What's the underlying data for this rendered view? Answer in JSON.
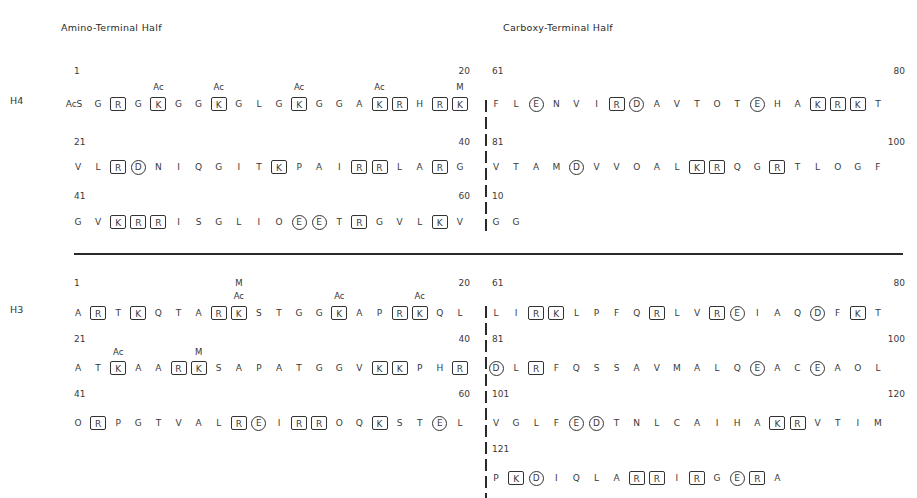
{
  "titles": {
    "amino": "Amino-Terminal Half",
    "carboxy": "Carboxy-Terminal Half"
  },
  "legend_semantics": {
    "box": "basic residue (K/R) boxed",
    "circle": "acidic residue (D/E) circled",
    "Ac": "acetylation site",
    "M": "methylation site"
  },
  "histones": [
    {
      "label": "H4",
      "label_y": 101,
      "rows": [
        {
          "side": "left",
          "start": "1",
          "end": "20",
          "num_y": 66,
          "seq_y": 97,
          "residues": [
            "AcS",
            "G",
            "R",
            "G",
            "K",
            "G",
            "G",
            "K",
            "G",
            "L",
            "G",
            "K",
            "G",
            "G",
            "A",
            "K",
            "R",
            "H",
            "R",
            "K"
          ],
          "marks": [
            "",
            "",
            "box",
            "",
            "box",
            "",
            "",
            "box",
            "",
            "",
            "",
            "box",
            "",
            "",
            "",
            "box",
            "box",
            "",
            "box",
            "box"
          ],
          "mods": [
            {
              "index": 4,
              "text": "Ac",
              "y": 82
            },
            {
              "index": 7,
              "text": "Ac",
              "y": 82
            },
            {
              "index": 11,
              "text": "Ac",
              "y": 82
            },
            {
              "index": 15,
              "text": "Ac",
              "y": 82
            },
            {
              "index": 19,
              "text": "M",
              "y": 82
            }
          ]
        },
        {
          "side": "left",
          "start": "21",
          "end": "40",
          "num_y": 137,
          "seq_y": 160,
          "residues": [
            "V",
            "L",
            "R",
            "D",
            "N",
            "I",
            "Q",
            "G",
            "I",
            "T",
            "K",
            "P",
            "A",
            "I",
            "R",
            "R",
            "L",
            "A",
            "R",
            "G"
          ],
          "marks": [
            "",
            "",
            "box",
            "circ",
            "",
            "",
            "",
            "",
            "",
            "",
            "box",
            "",
            "",
            "",
            "box",
            "box",
            "",
            "",
            "box",
            ""
          ],
          "mods": []
        },
        {
          "side": "left",
          "start": "41",
          "end": "60",
          "num_y": 191,
          "seq_y": 215,
          "residues": [
            "G",
            "V",
            "K",
            "R",
            "R",
            "I",
            "S",
            "G",
            "L",
            "I",
            "O",
            "E",
            "E",
            "T",
            "R",
            "G",
            "V",
            "L",
            "K",
            "V"
          ],
          "marks": [
            "",
            "",
            "box",
            "box",
            "box",
            "",
            "",
            "",
            "",
            "",
            "",
            "circ",
            "circ",
            "",
            "box",
            "",
            "",
            "",
            "box",
            ""
          ],
          "mods": []
        },
        {
          "side": "right",
          "start": "61",
          "end": "80",
          "num_y": 66,
          "seq_y": 97,
          "residues": [
            "F",
            "L",
            "E",
            "N",
            "V",
            "I",
            "R",
            "D",
            "A",
            "V",
            "T",
            "O",
            "T",
            "E",
            "H",
            "A",
            "K",
            "R",
            "K",
            "T"
          ],
          "marks": [
            "",
            "",
            "circ",
            "",
            "",
            "",
            "box",
            "circ",
            "",
            "",
            "",
            "",
            "",
            "circ",
            "",
            "",
            "box",
            "box",
            "box",
            ""
          ],
          "mods": []
        },
        {
          "side": "right",
          "start": "81",
          "end": "100",
          "num_y": 137,
          "seq_y": 160,
          "residues": [
            "V",
            "T",
            "A",
            "M",
            "D",
            "V",
            "V",
            "O",
            "A",
            "L",
            "K",
            "R",
            "Q",
            "G",
            "R",
            "T",
            "L",
            "O",
            "G",
            "F"
          ],
          "marks": [
            "",
            "",
            "",
            "",
            "circ",
            "",
            "",
            "",
            "",
            "",
            "box",
            "box",
            "",
            "",
            "box",
            "",
            "",
            "",
            "",
            ""
          ],
          "mods": []
        },
        {
          "side": "right",
          "start": "10",
          "end": "",
          "num_y": 191,
          "seq_y": 215,
          "residues": [
            "G",
            "G"
          ],
          "marks": [
            "",
            ""
          ],
          "mods": []
        }
      ]
    },
    {
      "label": "H3",
      "label_y": 310,
      "rows": [
        {
          "side": "left",
          "start": "1",
          "end": "20",
          "num_y": 278,
          "seq_y": 306,
          "residues": [
            "A",
            "R",
            "T",
            "K",
            "Q",
            "T",
            "A",
            "R",
            "K",
            "S",
            "T",
            "G",
            "G",
            "K",
            "A",
            "P",
            "R",
            "K",
            "Q",
            "L"
          ],
          "marks": [
            "",
            "box",
            "",
            "box",
            "",
            "",
            "",
            "box",
            "box",
            "",
            "",
            "",
            "",
            "box",
            "",
            "",
            "box",
            "box",
            "",
            ""
          ],
          "mods": [
            {
              "index": 8,
              "text": "M",
              "y": 278
            },
            {
              "index": 8,
              "text": "Ac",
              "y": 291
            },
            {
              "index": 13,
              "text": "Ac",
              "y": 291
            },
            {
              "index": 17,
              "text": "Ac",
              "y": 291
            }
          ]
        },
        {
          "side": "left",
          "start": "21",
          "end": "40",
          "num_y": 334,
          "seq_y": 361,
          "residues": [
            "A",
            "T",
            "K",
            "A",
            "A",
            "R",
            "K",
            "S",
            "A",
            "P",
            "A",
            "T",
            "G",
            "G",
            "V",
            "K",
            "K",
            "P",
            "H",
            "R"
          ],
          "marks": [
            "",
            "",
            "box",
            "",
            "",
            "box",
            "box",
            "",
            "",
            "",
            "",
            "",
            "",
            "",
            "",
            "box",
            "box",
            "",
            "",
            "box"
          ],
          "mods": [
            {
              "index": 2,
              "text": "Ac",
              "y": 347
            },
            {
              "index": 6,
              "text": "M",
              "y": 347
            }
          ]
        },
        {
          "side": "left",
          "start": "41",
          "end": "60",
          "num_y": 389,
          "seq_y": 416,
          "residues": [
            "O",
            "R",
            "P",
            "G",
            "T",
            "V",
            "A",
            "L",
            "R",
            "E",
            "I",
            "R",
            "R",
            "O",
            "Q",
            "K",
            "S",
            "T",
            "E",
            "L"
          ],
          "marks": [
            "",
            "box",
            "",
            "",
            "",
            "",
            "",
            "",
            "box",
            "circ",
            "",
            "box",
            "box",
            "",
            "",
            "box",
            "",
            "",
            "circ",
            ""
          ],
          "mods": []
        },
        {
          "side": "right",
          "start": "61",
          "end": "80",
          "num_y": 278,
          "seq_y": 306,
          "residues": [
            "L",
            "I",
            "R",
            "K",
            "L",
            "P",
            "F",
            "Q",
            "R",
            "L",
            "V",
            "R",
            "E",
            "I",
            "A",
            "Q",
            "D",
            "F",
            "K",
            "T"
          ],
          "marks": [
            "",
            "",
            "box",
            "box",
            "",
            "",
            "",
            "",
            "box",
            "",
            "",
            "box",
            "circ",
            "",
            "",
            "",
            "circ",
            "",
            "box",
            ""
          ],
          "mods": []
        },
        {
          "side": "right",
          "start": "81",
          "end": "100",
          "num_y": 334,
          "seq_y": 361,
          "residues": [
            "D",
            "L",
            "R",
            "F",
            "Q",
            "S",
            "S",
            "A",
            "V",
            "M",
            "A",
            "L",
            "Q",
            "E",
            "A",
            "C",
            "E",
            "A",
            "O",
            "L"
          ],
          "marks": [
            "circ",
            "",
            "box",
            "",
            "",
            "",
            "",
            "",
            "",
            "",
            "",
            "",
            "",
            "circ",
            "",
            "",
            "circ",
            "",
            "",
            ""
          ],
          "mods": []
        },
        {
          "side": "right",
          "start": "101",
          "end": "120",
          "num_y": 389,
          "seq_y": 416,
          "residues": [
            "V",
            "G",
            "L",
            "F",
            "E",
            "D",
            "T",
            "N",
            "L",
            "C",
            "A",
            "I",
            "H",
            "A",
            "K",
            "R",
            "V",
            "T",
            "I",
            "M"
          ],
          "marks": [
            "",
            "",
            "",
            "",
            "circ",
            "circ",
            "",
            "",
            "",
            "",
            "",
            "",
            "",
            "",
            "box",
            "box",
            "",
            "",
            "",
            ""
          ],
          "mods": []
        },
        {
          "side": "right",
          "start": "121",
          "end": "",
          "num_y": 444,
          "seq_y": 471,
          "residues": [
            "P",
            "K",
            "D",
            "I",
            "Q",
            "L",
            "A",
            "R",
            "R",
            "I",
            "R",
            "G",
            "E",
            "R",
            "A"
          ],
          "marks": [
            "",
            "box",
            "circ",
            "",
            "",
            "",
            "",
            "box",
            "box",
            "",
            "box",
            "",
            "circ",
            "box",
            ""
          ],
          "mods": []
        }
      ]
    }
  ],
  "layout": {
    "left_x0": 78,
    "right_x0": 496,
    "pitch": 20.1,
    "left_end_x": 470,
    "right_end_x": 905,
    "divider_y": 254,
    "divider_x0": 74,
    "divider_x1": 903,
    "vdash_x": 485,
    "vdash_h4": [
      100,
      232
    ],
    "vdash_h3": [
      306,
      498
    ]
  }
}
